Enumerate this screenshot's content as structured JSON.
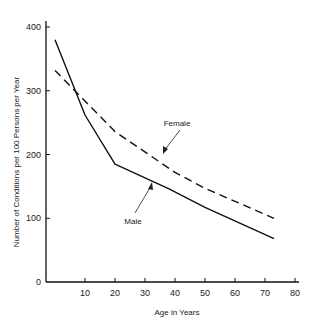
{
  "chart_data": {
    "type": "line",
    "title": "",
    "xlabel": "Age in Years",
    "ylabel": "Number of Conditions per 100 Persons per Year",
    "xlim": [
      -3,
      80
    ],
    "ylim": [
      0,
      400
    ],
    "x_ticks": [
      10,
      20,
      30,
      40,
      50,
      60,
      70,
      80
    ],
    "y_ticks": [
      0,
      100,
      200,
      300,
      400
    ],
    "grid": false,
    "legend": "inline annotations with arrows",
    "series": [
      {
        "name": "Male",
        "style": "solid",
        "x": [
          0,
          10,
          20,
          38,
          50,
          73
        ],
        "values": [
          380,
          262,
          185,
          146,
          117,
          68
        ]
      },
      {
        "name": "Female",
        "style": "dashed",
        "x": [
          0,
          20,
          40,
          50,
          73
        ],
        "values": [
          332,
          236,
          172,
          147,
          100
        ]
      }
    ],
    "annotations": [
      {
        "text": "Female",
        "points_to_series": "Female"
      },
      {
        "text": "Male",
        "points_to_series": "Male"
      }
    ]
  },
  "labels": {
    "xlabel": "Age in Years",
    "ylabel": "Number of Conditions per 100 Persons per Year",
    "female": "Female",
    "male": "Male"
  }
}
